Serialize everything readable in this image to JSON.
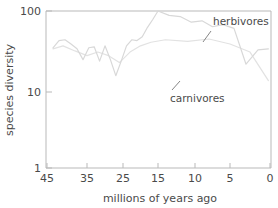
{
  "chart_data": {
    "type": "line",
    "title": "",
    "xlabel": "millions of years ago",
    "ylabel": "species diversity",
    "xlim": [
      45,
      0
    ],
    "ylim": [
      1,
      100
    ],
    "yscale": "log",
    "grid": false,
    "legend_position": "inline-annotations",
    "x_ticks": [
      45,
      35,
      25,
      15,
      10,
      5,
      0
    ],
    "x_tick_labels": [
      "45",
      "35",
      "25",
      "15",
      "10",
      "5",
      "0"
    ],
    "y_ticks": [
      1,
      10,
      100
    ],
    "y_tick_labels": [
      "1",
      "10",
      "100"
    ],
    "annotations": [
      {
        "text": "herbivores",
        "x": 6.5,
        "y": 62
      },
      {
        "text": "carnivores",
        "x": 13.5,
        "y": 6.6
      }
    ],
    "series": [
      {
        "name": "herbivores",
        "color": "#d8d8d8",
        "x": [
          43.5,
          42.0,
          40.5,
          39.0,
          37.5,
          36.0,
          34.5,
          33.0,
          31.5,
          30.0,
          28.5,
          27.0,
          25.5,
          24.0,
          22.5,
          21.0,
          19.5,
          18.0,
          16.5,
          15.0,
          13.5,
          12.0,
          10.5,
          9.0,
          7.5,
          6.0,
          4.5,
          3.0,
          1.5,
          0.2
        ],
        "values": [
          34,
          42,
          43,
          38,
          33,
          24,
          34,
          35,
          23,
          36,
          24,
          15,
          23,
          36,
          43,
          42,
          47,
          62,
          78,
          100,
          88,
          85,
          72,
          75,
          63,
          67,
          60,
          21,
          32,
          33
        ]
      },
      {
        "name": "carnivores",
        "color": "#e2e2e2",
        "x": [
          43.5,
          41.0,
          38.0,
          35.0,
          32.0,
          29.0,
          26.0,
          23.0,
          20.0,
          17.0,
          14.0,
          11.0,
          8.0,
          5.0,
          2.5,
          0.2
        ],
        "values": [
          33,
          36,
          31,
          27,
          30,
          27,
          22,
          30,
          36,
          40,
          43,
          41,
          44,
          38,
          30,
          13
        ]
      }
    ]
  },
  "axis": {
    "x_label": "millions of years ago",
    "y_label": "species diversity"
  }
}
